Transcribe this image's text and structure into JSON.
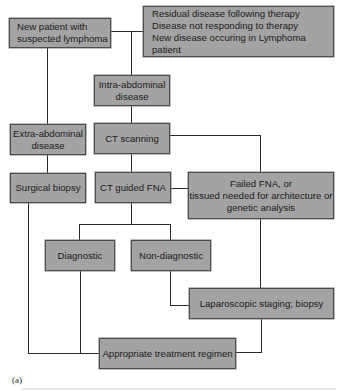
{
  "diagram": {
    "figure_label": "(a)",
    "nodes": {
      "new_patient": {
        "lines": [
          "New patient with",
          "suspected lymphoma"
        ]
      },
      "residual": {
        "lines": [
          "Residual disease following therapy",
          "Disease not responding to therapy",
          "New disease occuring in Lymphoma patient"
        ]
      },
      "intra_abdominal": {
        "lines": [
          "Intra-abdominal",
          "disease"
        ]
      },
      "extra_abdominal": {
        "lines": [
          "Extra-abdominal",
          "disease"
        ]
      },
      "ct_scanning": {
        "lines": [
          "CT scanning"
        ]
      },
      "surgical_biopsy": {
        "lines": [
          "Surgical biopsy"
        ]
      },
      "ct_guided_fna": {
        "lines": [
          "CT guided FNA"
        ]
      },
      "failed_fna": {
        "lines": [
          "Failed FNA, or",
          "tissued needed for architecture or",
          "genetic analysis"
        ]
      },
      "diagnostic": {
        "lines": [
          "Diagnostic"
        ]
      },
      "non_diagnostic": {
        "lines": [
          "Non-diagnostic"
        ]
      },
      "laparoscopic": {
        "lines": [
          "Laparoscopic staging; biopsy"
        ]
      },
      "treatment": {
        "lines": [
          "Appropriate treatment regimen"
        ]
      }
    },
    "edges": [
      [
        "new_patient",
        "residual"
      ],
      [
        "new_patient",
        "intra_abdominal"
      ],
      [
        "new_patient",
        "extra_abdominal"
      ],
      [
        "intra_abdominal",
        "ct_scanning"
      ],
      [
        "extra_abdominal",
        "surgical_biopsy"
      ],
      [
        "ct_scanning",
        "ct_guided_fna"
      ],
      [
        "ct_scanning",
        "failed_fna"
      ],
      [
        "ct_guided_fna",
        "failed_fna"
      ],
      [
        "ct_guided_fna",
        "diagnostic"
      ],
      [
        "ct_guided_fna",
        "non_diagnostic"
      ],
      [
        "non_diagnostic",
        "laparoscopic"
      ],
      [
        "failed_fna",
        "laparoscopic"
      ],
      [
        "surgical_biopsy",
        "treatment"
      ],
      [
        "diagnostic",
        "treatment"
      ],
      [
        "laparoscopic",
        "treatment"
      ]
    ],
    "colors": {
      "box_fill": "#a3a3a3",
      "box_border": "#4d4d4d",
      "line": "#2a2a2a",
      "text": "#1c1c1c"
    }
  }
}
